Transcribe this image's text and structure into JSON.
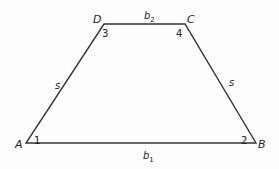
{
  "figure": {
    "shape": "isosceles trapezoid",
    "vertices": [
      {
        "name": "A",
        "x": 26,
        "y": 143,
        "lx": 15,
        "ly": 148
      },
      {
        "name": "B",
        "x": 256,
        "y": 143,
        "lx": 258,
        "ly": 148
      },
      {
        "name": "C",
        "x": 185,
        "y": 24,
        "lx": 187,
        "ly": 23
      },
      {
        "name": "D",
        "x": 104,
        "y": 24,
        "lx": 93,
        "ly": 23
      }
    ],
    "angles": [
      {
        "label": "1",
        "x": 34,
        "y": 144
      },
      {
        "label": "2",
        "x": 241,
        "y": 144
      },
      {
        "label": "3",
        "x": 102,
        "y": 37
      },
      {
        "label": "4",
        "x": 176,
        "y": 37
      }
    ],
    "sides": [
      {
        "label": "b",
        "sub": "1",
        "x": 143,
        "y": 159
      },
      {
        "label": "b",
        "sub": "2",
        "x": 144,
        "y": 19
      },
      {
        "label": "s",
        "sub": "",
        "x": 55,
        "y": 89
      },
      {
        "label": "s",
        "sub": "",
        "x": 229,
        "y": 86
      }
    ],
    "stroke_color": "#333333"
  }
}
